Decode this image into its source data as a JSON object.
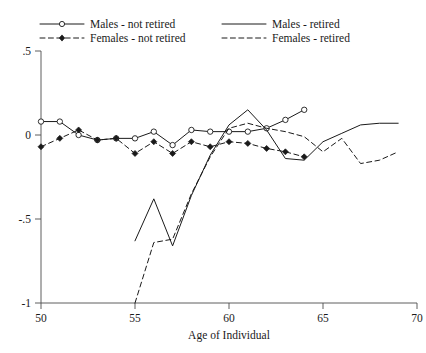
{
  "chart_data": {
    "type": "line",
    "title": "",
    "xlabel": "Age of Individual",
    "ylabel": "",
    "xlim": [
      50,
      70
    ],
    "ylim": [
      -1.0,
      0.5
    ],
    "xticks": [
      50,
      55,
      60,
      65,
      70
    ],
    "xtick_labels": [
      "50",
      "55",
      "60",
      "65",
      "70"
    ],
    "yticks": [
      0.5,
      0,
      -0.5,
      -1
    ],
    "ytick_labels": [
      ".5",
      "0",
      "-.5",
      "-1"
    ],
    "grid": false,
    "legend_position": "top",
    "series": [
      {
        "name": "Males - not retired",
        "marker": "open-circle",
        "linestyle": "solid",
        "x": [
          50,
          51,
          52,
          53,
          54,
          55,
          56,
          57,
          58,
          59,
          60,
          61,
          62,
          63,
          64
        ],
        "values": [
          0.08,
          0.08,
          0.0,
          -0.03,
          -0.02,
          -0.02,
          0.02,
          -0.06,
          0.03,
          0.02,
          0.02,
          0.02,
          0.04,
          0.09,
          0.15
        ]
      },
      {
        "name": "Females - not retired",
        "marker": "filled-diamond",
        "linestyle": "dashed",
        "x": [
          50,
          51,
          52,
          53,
          54,
          55,
          56,
          57,
          58,
          59,
          60,
          61,
          62,
          63,
          64
        ],
        "values": [
          -0.07,
          -0.02,
          0.03,
          -0.03,
          -0.02,
          -0.11,
          -0.04,
          -0.11,
          -0.04,
          -0.07,
          -0.04,
          -0.05,
          -0.08,
          -0.1,
          -0.13
        ]
      },
      {
        "name": "Males - retired",
        "marker": "none",
        "linestyle": "solid",
        "x": [
          55,
          56,
          57,
          58,
          59,
          60,
          61,
          62,
          63,
          64,
          65,
          66,
          67,
          68,
          69
        ],
        "values": [
          -0.63,
          -0.38,
          -0.66,
          -0.36,
          -0.12,
          0.06,
          0.15,
          0.03,
          -0.14,
          -0.15,
          -0.04,
          0.01,
          0.06,
          0.07,
          0.07
        ]
      },
      {
        "name": "Females - retired",
        "marker": "none",
        "linestyle": "dashed",
        "x": [
          55,
          56,
          57,
          58,
          59,
          60,
          61,
          62,
          63,
          64,
          65,
          66,
          67,
          68,
          69
        ],
        "values": [
          -1.0,
          -0.64,
          -0.62,
          -0.35,
          -0.13,
          0.04,
          0.07,
          0.04,
          0.02,
          -0.01,
          -0.1,
          -0.02,
          -0.17,
          -0.15,
          -0.1
        ]
      }
    ]
  },
  "legend": {
    "entries": [
      {
        "label": "Males - not retired",
        "marker": "open-circle",
        "linestyle": "solid"
      },
      {
        "label": "Males - retired",
        "marker": "none",
        "linestyle": "solid"
      },
      {
        "label": "Females - not retired",
        "marker": "filled-diamond",
        "linestyle": "dashed"
      },
      {
        "label": "Females - retired",
        "marker": "none",
        "linestyle": "dashed"
      }
    ]
  },
  "colors": {
    "line": "#1a1a1a",
    "axis": "#4d4d4d",
    "background": "#ffffff"
  }
}
